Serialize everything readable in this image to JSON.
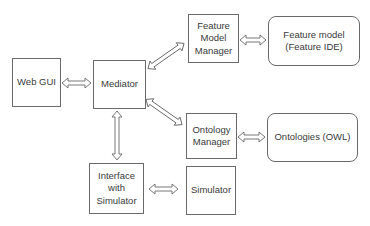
{
  "diagram": {
    "type": "architecture-block-diagram",
    "nodes": [
      {
        "id": "web_gui",
        "label": "Web GUI",
        "shape": "rect"
      },
      {
        "id": "mediator",
        "label": "Mediator",
        "shape": "rect"
      },
      {
        "id": "feature_model_manager",
        "label": "Feature\nModel\nManager",
        "shape": "rect"
      },
      {
        "id": "feature_model",
        "label": "Feature model\n(Feature IDE)",
        "shape": "rounded-rect"
      },
      {
        "id": "ontology_manager",
        "label": "Ontology\nManager",
        "shape": "rect"
      },
      {
        "id": "ontologies",
        "label": "Ontologies (OWL)",
        "shape": "rounded-rect"
      },
      {
        "id": "interface_simulator",
        "label": "Interface\nwith\nSimulator",
        "shape": "rect"
      },
      {
        "id": "simulator",
        "label": "Simulator",
        "shape": "rect"
      }
    ],
    "edges": [
      {
        "from": "web_gui",
        "to": "mediator",
        "style": "double-arrow"
      },
      {
        "from": "mediator",
        "to": "feature_model_manager",
        "style": "double-arrow"
      },
      {
        "from": "mediator",
        "to": "ontology_manager",
        "style": "double-arrow"
      },
      {
        "from": "mediator",
        "to": "interface_simulator",
        "style": "double-arrow"
      },
      {
        "from": "feature_model_manager",
        "to": "feature_model",
        "style": "double-arrow"
      },
      {
        "from": "ontology_manager",
        "to": "ontologies",
        "style": "double-arrow"
      },
      {
        "from": "interface_simulator",
        "to": "simulator",
        "style": "double-arrow"
      }
    ]
  },
  "labels": {
    "web_gui": "Web GUI",
    "mediator": "Mediator",
    "feature_model_manager": "Feature\nModel\nManager",
    "feature_model": "Feature model\n(Feature IDE)",
    "ontology_manager": "Ontology\nManager",
    "ontologies": "Ontologies (OWL)",
    "interface_simulator": "Interface\nwith\nSimulator",
    "simulator": "Simulator"
  }
}
